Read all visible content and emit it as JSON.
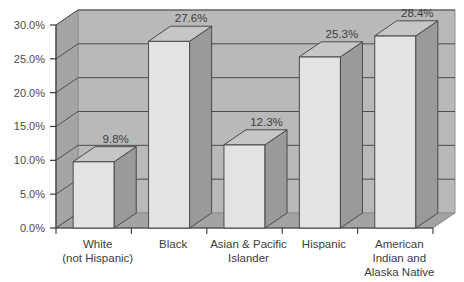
{
  "chart_data": {
    "type": "bar",
    "title": "",
    "subtitle": "",
    "xlabel": "",
    "ylabel": "",
    "categories": [
      "White\n(not Hispanic)",
      "Black",
      "Asian & Pacific\nIslander",
      "Hispanic",
      "American\nIndian and\nAlaska Native"
    ],
    "category_lines": [
      [
        "White",
        "(not Hispanic)"
      ],
      [
        "Black"
      ],
      [
        "Asian & Pacific",
        "Islander"
      ],
      [
        "Hispanic"
      ],
      [
        "American",
        "Indian and",
        "Alaska Native"
      ]
    ],
    "values": [
      9.8,
      27.6,
      12.3,
      25.3,
      28.4
    ],
    "data_labels": [
      "9.8%",
      "27.6%",
      "12.3%",
      "25.3%",
      "28.4%"
    ],
    "ylim": [
      0,
      30
    ],
    "ytick_values": [
      0,
      5,
      10,
      15,
      20,
      25,
      30
    ],
    "ytick_labels": [
      "0.0%",
      "5.0%",
      "10.0%",
      "15.0%",
      "20.0%",
      "25.0%",
      "30.0%"
    ],
    "grid": true,
    "legend": "none",
    "style": "3d-column",
    "colors": {
      "background": "#ffffff",
      "back_wall": "#b9b9b9",
      "side_wall": "#a9a9a9",
      "floor": "#a3a3a3",
      "grid_line": "#4d4d4d",
      "axis_line": "#3a3a3a",
      "bar_front": "#e3e3e3",
      "bar_side": "#9a9a9a",
      "bar_top": "#c6c6c6",
      "bar_outline": "#4a4a4a",
      "text": "#3d3d3d"
    }
  }
}
